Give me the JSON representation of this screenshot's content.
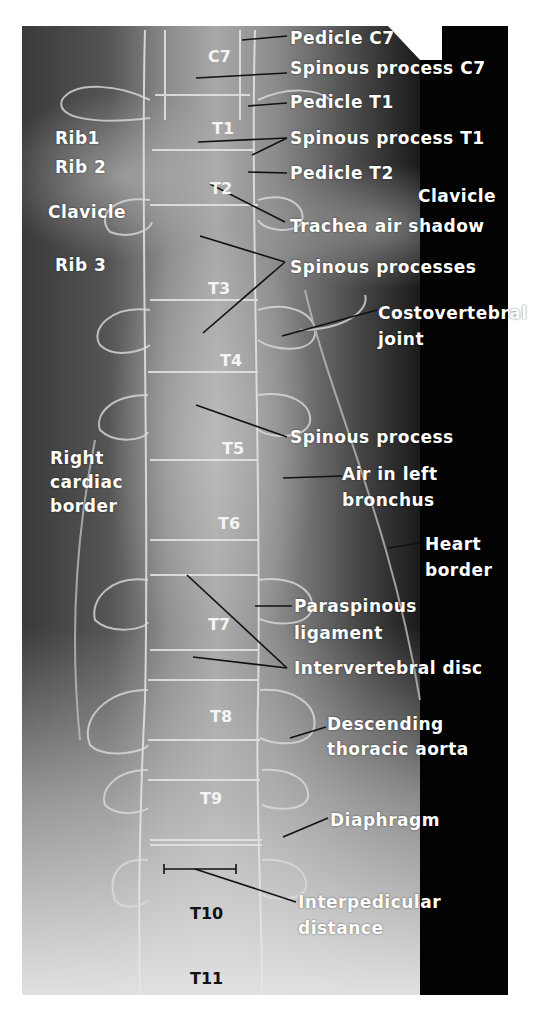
{
  "figure": {
    "type": "AP thoracic spine radiograph",
    "vertebrae": [
      {
        "id": "c7",
        "label": "C7",
        "x": 208,
        "y": 48
      },
      {
        "id": "t1",
        "label": "T1",
        "x": 212,
        "y": 120
      },
      {
        "id": "t2",
        "label": "T2",
        "x": 210,
        "y": 180
      },
      {
        "id": "t3",
        "label": "T3",
        "x": 208,
        "y": 280
      },
      {
        "id": "t4",
        "label": "T4",
        "x": 220,
        "y": 352
      },
      {
        "id": "t5",
        "label": "T5",
        "x": 222,
        "y": 440
      },
      {
        "id": "t6",
        "label": "T6",
        "x": 218,
        "y": 515
      },
      {
        "id": "t7",
        "label": "T7",
        "x": 208,
        "y": 616
      },
      {
        "id": "t8",
        "label": "T8",
        "x": 210,
        "y": 708
      },
      {
        "id": "t9",
        "label": "T9",
        "x": 200,
        "y": 790
      },
      {
        "id": "t10",
        "label": "T10",
        "x": 190,
        "y": 905,
        "dark": true
      },
      {
        "id": "t11",
        "label": "T11",
        "x": 190,
        "y": 970,
        "dark": true
      }
    ],
    "left_labels": [
      {
        "id": "rib1",
        "label": "Rib1",
        "x": 55,
        "y": 128
      },
      {
        "id": "rib2",
        "label": "Rib 2",
        "x": 55,
        "y": 157
      },
      {
        "id": "clavicle-right",
        "label": "Clavicle",
        "x": 48,
        "y": 202
      },
      {
        "id": "rib3",
        "label": "Rib 3",
        "x": 55,
        "y": 255
      },
      {
        "id": "right-cardiac-border-1",
        "label": "Right",
        "x": 50,
        "y": 448
      },
      {
        "id": "right-cardiac-border-2",
        "label": "cardiac",
        "x": 50,
        "y": 472
      },
      {
        "id": "right-cardiac-border-3",
        "label": "border",
        "x": 50,
        "y": 496
      }
    ],
    "right_labels": [
      {
        "id": "pedicle-c7",
        "label": "Pedicle C7",
        "x": 290,
        "y": 28
      },
      {
        "id": "spinous-process-c7",
        "label": "Spinous process C7",
        "x": 290,
        "y": 58
      },
      {
        "id": "pedicle-t1",
        "label": "Pedicle T1",
        "x": 290,
        "y": 92
      },
      {
        "id": "spinous-process-t1",
        "label": "Spinous process T1",
        "x": 290,
        "y": 128
      },
      {
        "id": "pedicle-t2",
        "label": "Pedicle T2",
        "x": 290,
        "y": 163
      },
      {
        "id": "clavicle-left",
        "label": "Clavicle",
        "x": 418,
        "y": 186
      },
      {
        "id": "trachea-air-shadow",
        "label": "Trachea air shadow",
        "x": 290,
        "y": 216
      },
      {
        "id": "spinous-processes",
        "label": "Spinous processes",
        "x": 290,
        "y": 257
      },
      {
        "id": "costovertebral-joint-1",
        "label": "Costovertebral",
        "x": 378,
        "y": 303
      },
      {
        "id": "costovertebral-joint-2",
        "label": "joint",
        "x": 378,
        "y": 329
      },
      {
        "id": "spinous-process",
        "label": "Spinous process",
        "x": 290,
        "y": 427
      },
      {
        "id": "air-left-bronchus-1",
        "label": "Air in left",
        "x": 342,
        "y": 464
      },
      {
        "id": "air-left-bronchus-2",
        "label": "bronchus",
        "x": 342,
        "y": 490
      },
      {
        "id": "heart-border-1",
        "label": "Heart",
        "x": 425,
        "y": 534
      },
      {
        "id": "heart-border-2",
        "label": "border",
        "x": 425,
        "y": 560
      },
      {
        "id": "paraspinous-ligament-1",
        "label": "Paraspinous",
        "x": 294,
        "y": 596
      },
      {
        "id": "paraspinous-ligament-2",
        "label": "ligament",
        "x": 294,
        "y": 623
      },
      {
        "id": "intervertebral-disc",
        "label": "Intervertebral disc",
        "x": 294,
        "y": 658
      },
      {
        "id": "descending-aorta-1",
        "label": "Descending",
        "x": 327,
        "y": 714
      },
      {
        "id": "descending-aorta-2",
        "label": "thoracic aorta",
        "x": 327,
        "y": 739
      },
      {
        "id": "diaphragm",
        "label": "Diaphragm",
        "x": 330,
        "y": 810
      },
      {
        "id": "interpedicular-distance-1",
        "label": "Interpedicular",
        "x": 298,
        "y": 892
      },
      {
        "id": "interpedicular-distance-2",
        "label": "distance",
        "x": 298,
        "y": 918
      }
    ]
  },
  "colors": {
    "background": "#ffffff",
    "film_dark": "#030303",
    "label_text": "#ffffff",
    "leader_line": "#111111",
    "bone_outline": "#e8e8e8"
  }
}
